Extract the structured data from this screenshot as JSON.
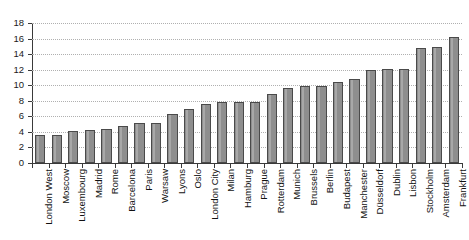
{
  "chart_data": {
    "type": "bar",
    "title": "",
    "subtitle": "",
    "xlabel": "",
    "ylabel": "",
    "ylim": [
      0,
      18
    ],
    "ytick_step": 2,
    "yticks": [
      0,
      2,
      4,
      6,
      8,
      10,
      12,
      14,
      16,
      18
    ],
    "grid": true,
    "grid_style": "dotted-horizontal",
    "legend": "none",
    "bar_color": "#8e8e8e",
    "bar_edge_color": "#4a4a4a",
    "categories": [
      "London West",
      "Moscow",
      "Luxembourg",
      "Madrid",
      "Rome",
      "Barcelona",
      "Paris",
      "Warsaw",
      "Lyons",
      "Oslo",
      "London City",
      "Milan",
      "Hamburg",
      "Prague",
      "Rotterdam",
      "Munich",
      "Brussels",
      "Berlin",
      "Budapest",
      "Manchester",
      "Düsseldorf",
      "Dublin",
      "Lisbon",
      "Stockholm",
      "Amsterdam",
      "Frankfurt"
    ],
    "values": [
      3.6,
      3.6,
      4.1,
      4.3,
      4.4,
      4.8,
      5.1,
      5.2,
      6.3,
      7.0,
      7.6,
      7.8,
      7.9,
      7.9,
      8.9,
      9.7,
      9.9,
      9.9,
      10.4,
      10.8,
      11.9,
      12.1,
      12.1,
      14.8,
      14.9,
      16.2
    ]
  }
}
